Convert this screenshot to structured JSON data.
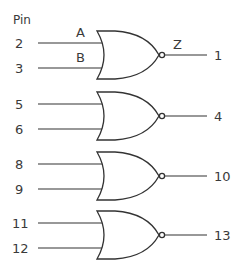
{
  "diagram": {
    "type": "quad 2-input NOR gate pinout",
    "pin_header": "Pin",
    "signal_labels": {
      "input_a": "A",
      "input_b": "B",
      "output": "Z"
    },
    "gates": [
      {
        "id": "gate-1",
        "inputs": [
          "2",
          "3"
        ],
        "output": "1",
        "y_top": 31
      },
      {
        "id": "gate-2",
        "inputs": [
          "5",
          "6"
        ],
        "output": "4",
        "y_top": 92
      },
      {
        "id": "gate-3",
        "inputs": [
          "8",
          "9"
        ],
        "output": "10",
        "y_top": 152
      },
      {
        "id": "gate-4",
        "inputs": [
          "11",
          "12"
        ],
        "output": "13",
        "y_top": 211
      }
    ],
    "colors": {
      "line": "#333333",
      "text": "#3a3a3a",
      "background": "#ffffff"
    }
  }
}
